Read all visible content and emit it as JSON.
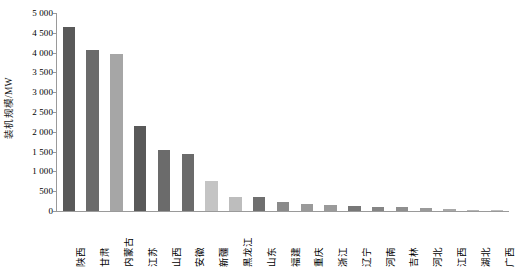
{
  "chart_data": {
    "type": "bar",
    "title": "",
    "xlabel": "",
    "ylabel": "装机规模/MW",
    "ylim": [
      0,
      5000
    ],
    "grid": false,
    "legend": "none",
    "y_ticks": [
      "0",
      "500",
      "1 000",
      "1 500",
      "2 000",
      "2 500",
      "3 000",
      "3 500",
      "4 000",
      "4 500",
      "5 000"
    ],
    "y_tick_values": [
      0,
      500,
      1000,
      1500,
      2000,
      2500,
      3000,
      3500,
      4000,
      4500,
      5000
    ],
    "categories": [
      "陕西",
      "甘肃",
      "内蒙古",
      "江苏",
      "山西",
      "安徽",
      "新疆",
      "黑龙江",
      "山东",
      "福建",
      "重庆",
      "浙江",
      "辽宁",
      "河南",
      "吉林",
      "河北",
      "江西",
      "湖北",
      "广西"
    ],
    "values": [
      4640,
      4070,
      3970,
      2140,
      1540,
      1450,
      770,
      365,
      350,
      235,
      170,
      140,
      125,
      110,
      95,
      65,
      40,
      25,
      15
    ],
    "bar_colors": [
      "#595959",
      "#6b6b6b",
      "#a6a6a6",
      "#595959",
      "#6b6b6b",
      "#6b6b6b",
      "#c4c4c4",
      "#bdbdbd",
      "#6f6f6f",
      "#8a8a8a",
      "#9a9a9a",
      "#9a9a9a",
      "#777777",
      "#858585",
      "#8f8f8f",
      "#9a9a9a",
      "#a8a8a8",
      "#b5b5b5",
      "#bdbdbd"
    ]
  },
  "axis": {
    "axis_color": "#9a9a9a",
    "background": "#ffffff"
  }
}
